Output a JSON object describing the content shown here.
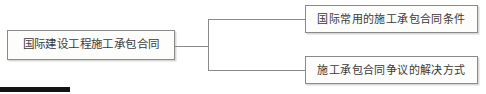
{
  "diagram": {
    "type": "tree",
    "orientation": "left-to-right",
    "background_color": "#ffffff",
    "border_color": "#8a8a8a",
    "text_color": "#3a3a3a",
    "root": {
      "label": "国际建设工程施工承包合同"
    },
    "children": [
      {
        "label": "国际常用的施工承包合同条件"
      },
      {
        "label": "施工承包合同争议的解决方式"
      }
    ],
    "artifact": {
      "name": "scan-artifact-bar",
      "color": "#141414"
    }
  }
}
